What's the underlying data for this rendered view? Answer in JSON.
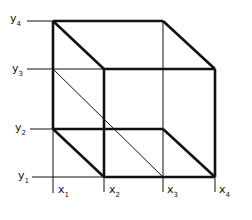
{
  "diagram": {
    "type": "isometric-grid-cube",
    "stroke_color": "#111111",
    "background": "#ffffff",
    "x_labels": [
      {
        "base": "x",
        "sub": "1",
        "x": 53
      },
      {
        "base": "x",
        "sub": "2",
        "x": 104
      },
      {
        "base": "x",
        "sub": "3",
        "x": 163
      },
      {
        "base": "x",
        "sub": "4",
        "x": 215
      }
    ],
    "y_labels": [
      {
        "base": "y",
        "sub": "4",
        "y": 21
      },
      {
        "base": "y",
        "sub": "3",
        "y": 69
      },
      {
        "base": "y",
        "sub": "2",
        "y": 129
      },
      {
        "base": "y",
        "sub": "1",
        "y": 177
      }
    ]
  }
}
